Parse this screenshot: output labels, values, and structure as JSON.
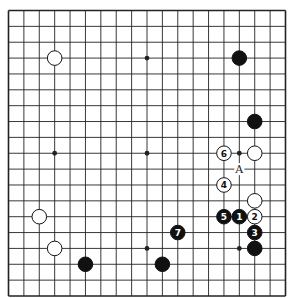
{
  "diagram": {
    "type": "go-board",
    "size": 19,
    "colors": {
      "background": "#ffffff",
      "line": "#222222",
      "black": "#111111",
      "white": "#ffffff"
    },
    "hoshi": [
      [
        3,
        3
      ],
      [
        9,
        3
      ],
      [
        15,
        3
      ],
      [
        3,
        9
      ],
      [
        9,
        9
      ],
      [
        15,
        9
      ],
      [
        3,
        15
      ],
      [
        9,
        15
      ],
      [
        15,
        15
      ]
    ],
    "stones": [
      {
        "color": "white",
        "col": 3,
        "row": 3,
        "label": ""
      },
      {
        "color": "black",
        "col": 15,
        "row": 3,
        "label": ""
      },
      {
        "color": "black",
        "col": 16,
        "row": 7,
        "label": ""
      },
      {
        "color": "white",
        "col": 16,
        "row": 9,
        "label": ""
      },
      {
        "color": "white",
        "col": 14,
        "row": 9,
        "label": "6"
      },
      {
        "color": "white",
        "col": 14,
        "row": 11,
        "label": "4"
      },
      {
        "color": "white",
        "col": 16,
        "row": 12,
        "label": ""
      },
      {
        "color": "black",
        "col": 14,
        "row": 13,
        "label": "5"
      },
      {
        "color": "black",
        "col": 15,
        "row": 13,
        "label": "1"
      },
      {
        "color": "white",
        "col": 16,
        "row": 13,
        "label": "2"
      },
      {
        "color": "black",
        "col": 16,
        "row": 14,
        "label": "3"
      },
      {
        "color": "black",
        "col": 11,
        "row": 14,
        "label": "7"
      },
      {
        "color": "black",
        "col": 16,
        "row": 15,
        "label": ""
      },
      {
        "color": "white",
        "col": 2,
        "row": 13,
        "label": ""
      },
      {
        "color": "white",
        "col": 3,
        "row": 15,
        "label": ""
      },
      {
        "color": "black",
        "col": 5,
        "row": 16,
        "label": ""
      },
      {
        "color": "black",
        "col": 10,
        "row": 16,
        "label": ""
      }
    ],
    "marks": [
      {
        "col": 15,
        "row": 10,
        "label": "A"
      }
    ]
  }
}
